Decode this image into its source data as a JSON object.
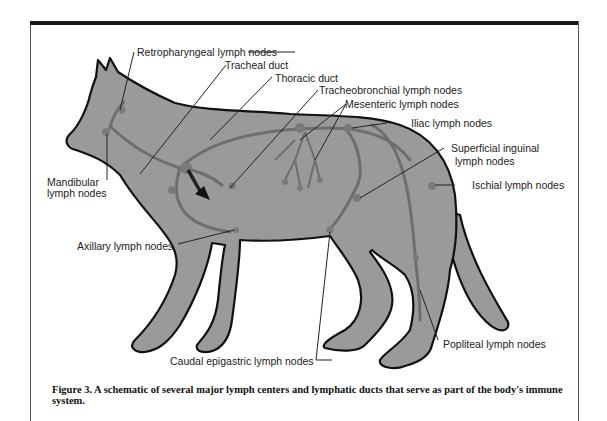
{
  "figure": {
    "caption": "Figure 3. A schematic of several major lymph centers and lymphatic ducts that serve as part of the body's immune system.",
    "colors": {
      "body_fill": "#9a9a9a",
      "outline": "#111111",
      "lymph_vessel": "#6e6e6e",
      "frame_bar": "#1a1a1a"
    }
  },
  "labels": {
    "retropharyngeal": "Retropharyngeal lymph nodes",
    "tracheal_duct": "Tracheal duct",
    "thoracic_duct": "Thoracic duct",
    "tracheobronchial": "Tracheobronchial lymph nodes",
    "mesenteric": "Mesenteric lymph nodes",
    "iliac": "Iliac lymph nodes",
    "superficial_inguinal_1": "Superficial inguinal",
    "superficial_inguinal_2": "lymph nodes",
    "ischial": "Ischial lymph nodes",
    "mandibular_1": "Mandibular",
    "mandibular_2": "lymph nodes",
    "axillary": "Axillary lymph nodes",
    "caudal_epigastric": "Caudal epigastric lymph nodes",
    "popliteal": "Popliteal lymph nodes"
  }
}
